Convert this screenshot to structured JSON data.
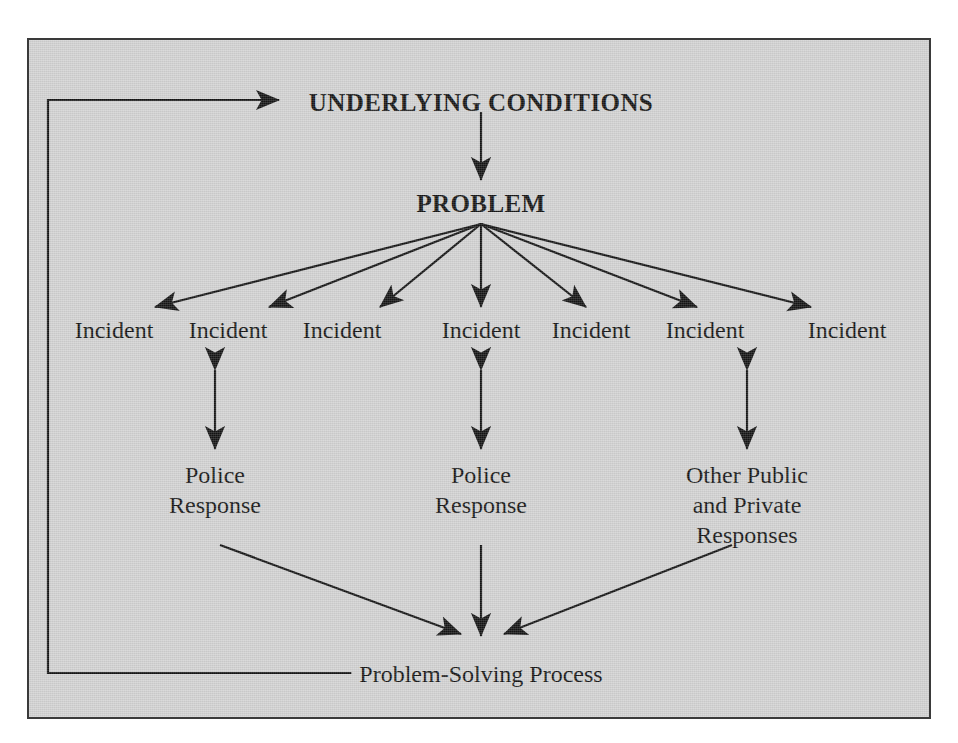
{
  "figure": {
    "type": "flow-diagram",
    "background_color": "#d2d3d2",
    "ink_color": "#151515",
    "border_color": "#3a3a3a"
  },
  "nodes": {
    "underlying_conditions": "UNDERLYING CONDITIONS",
    "problem": "PROBLEM",
    "incident": "Incident",
    "police_response_line1": "Police",
    "police_response_line2": "Response",
    "other_responses_line1": "Other Public",
    "other_responses_line2": "and Private",
    "other_responses_line3": "Responses",
    "problem_solving_process": "Problem-Solving Process"
  },
  "incidents": [
    {
      "label": "Incident"
    },
    {
      "label": "Incident"
    },
    {
      "label": "Incident"
    },
    {
      "label": "Incident"
    },
    {
      "label": "Incident"
    },
    {
      "label": "Incident"
    },
    {
      "label": "Incident"
    }
  ],
  "responses": [
    {
      "lines": [
        "Police",
        "Response"
      ]
    },
    {
      "lines": [
        "Police",
        "Response"
      ]
    },
    {
      "lines": [
        "Other Public",
        "and Private",
        "Responses"
      ]
    }
  ],
  "edges": [
    {
      "from": "UNDERLYING CONDITIONS",
      "to": "PROBLEM",
      "style": "single-arrow-down"
    },
    {
      "from": "PROBLEM",
      "to": "Incident",
      "style": "fan-out-seven-arrows"
    },
    {
      "from": "Incident",
      "to": "Police Response",
      "style": "double-headed-arrow"
    },
    {
      "from": "Incident",
      "to": "Police Response",
      "style": "double-headed-arrow"
    },
    {
      "from": "Incident",
      "to": "Other Public and Private Responses",
      "style": "double-headed-arrow"
    },
    {
      "from": "Police Response",
      "to": "Problem-Solving Process",
      "style": "single-arrow-diagonal"
    },
    {
      "from": "Police Response",
      "to": "Problem-Solving Process",
      "style": "single-arrow-down"
    },
    {
      "from": "Other Public and Private Responses",
      "to": "Problem-Solving Process",
      "style": "single-arrow-diagonal"
    },
    {
      "from": "Problem-Solving Process",
      "to": "UNDERLYING CONDITIONS",
      "style": "feedback-loop-left"
    }
  ]
}
